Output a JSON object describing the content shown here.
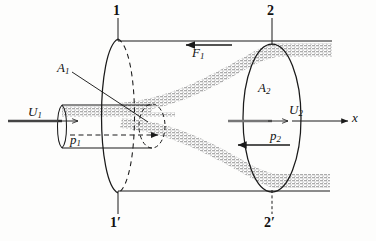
{
  "figure": {
    "type": "engineering-diagram",
    "colors": {
      "line": "#1a1a1a",
      "shading": "#b9b9b9",
      "background": "#fdfdfc",
      "arrow_gray": "#6e6e6e"
    }
  },
  "labels": {
    "station_1_top": "1",
    "station_1_bottom": "1′",
    "station_2_top": "2",
    "station_2_bottom": "2′",
    "area_1": "A",
    "area_1_sub": "1",
    "area_2": "A",
    "area_2_sub": "2",
    "velocity_1": "U",
    "velocity_1_sub": "1",
    "velocity_2": "U",
    "velocity_2_sub": "2",
    "pressure_1": "p",
    "pressure_1_sub": "1",
    "pressure_2": "p",
    "pressure_2_sub": "2",
    "force": "F",
    "force_sub": "1",
    "axis_x": "x"
  },
  "annotations": {
    "inlet_velocity_direction": "right",
    "outlet_velocity_direction": "right",
    "pressure_1_direction": "right",
    "pressure_2_direction": "left",
    "force_direction": "left",
    "axis_direction": "right"
  }
}
